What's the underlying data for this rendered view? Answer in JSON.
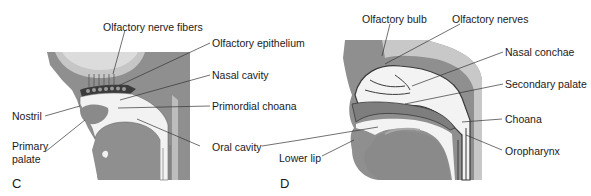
{
  "figure": {
    "panels": [
      {
        "id": "C",
        "letter": "C",
        "labels": {
          "olfactory_nerve_fibers": "Olfactory nerve fibers",
          "olfactory_epithelium": "Olfactory epithelium",
          "nasal_cavity": "Nasal cavity",
          "primordial_choana": "Primordial choana",
          "oral_cavity": "Oral cavity",
          "nostril": "Nostril",
          "primary_palate_line1": "Primary",
          "primary_palate_line2": "palate"
        }
      },
      {
        "id": "D",
        "letter": "D",
        "labels": {
          "olfactory_bulb": "Olfactory bulb",
          "olfactory_nerves": "Olfactory nerves",
          "nasal_conchae": "Nasal conchae",
          "secondary_palate": "Secondary palate",
          "choana": "Choana",
          "oropharynx": "Oropharynx",
          "lower_lip": "Lower lip"
        }
      }
    ],
    "colors": {
      "background": "#ffffff",
      "dark_tissue": "#8a8a8a",
      "medium_tissue": "#a8a8a8",
      "light_tissue": "#cfcfcf",
      "cavity": "#f4f4f4",
      "outline": "#3a3a3a",
      "text": "#1a1a1a",
      "leader_line": "#333333"
    }
  }
}
